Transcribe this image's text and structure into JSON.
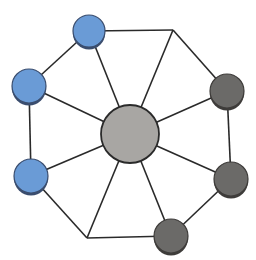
{
  "diagram": {
    "type": "network-topology",
    "colors": {
      "edge": "#2a2a2a",
      "blue_node": "#6a9bd6",
      "blue_rim": "#3a4d6e",
      "dark_node": "#6b6a68",
      "dark_rim": "#3e3c3a",
      "hub_node": "#a8a6a3",
      "hub_stroke": "#2a2a2a"
    },
    "hub": {
      "id": "hub",
      "x": 130,
      "y": 134,
      "r": 29
    },
    "ring": [
      {
        "id": "top",
        "kind": "blue",
        "x": 89,
        "y": 31,
        "r": 16
      },
      {
        "id": "top-right-junction",
        "kind": "junction",
        "x": 173,
        "y": 30
      },
      {
        "id": "right-upper",
        "kind": "dark",
        "x": 227,
        "y": 91,
        "r": 17
      },
      {
        "id": "right-lower",
        "kind": "dark",
        "x": 231,
        "y": 179,
        "r": 17
      },
      {
        "id": "bottom",
        "kind": "dark",
        "x": 171,
        "y": 236,
        "r": 17
      },
      {
        "id": "bottom-left-junction",
        "kind": "junction",
        "x": 87,
        "y": 238
      },
      {
        "id": "left-lower",
        "kind": "blue",
        "x": 31,
        "y": 176,
        "r": 17
      },
      {
        "id": "left-upper",
        "kind": "blue",
        "x": 29,
        "y": 86,
        "r": 17
      }
    ]
  }
}
